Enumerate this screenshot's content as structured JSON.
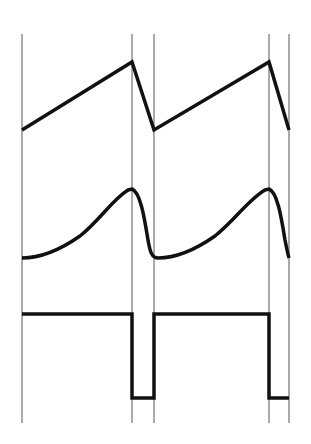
{
  "diagram": {
    "title": "",
    "colors": {
      "background": "#ffffff",
      "waveform": "#111111",
      "marker_line": "#555555"
    },
    "markers_x": [
      22,
      132,
      154,
      269,
      289
    ],
    "marker_y_range": [
      34,
      423
    ],
    "waveforms": [
      {
        "name": "sawtooth",
        "points": [
          [
            22,
            130
          ],
          [
            132,
            62
          ],
          [
            154,
            130
          ],
          [
            269,
            62
          ],
          [
            289,
            130
          ]
        ]
      },
      {
        "name": "smooth-wave",
        "path": "M22,258 C40,258 60,250 80,236 C100,220 112,200 128,190 L132,189 C140,192 144,215 148,240 C150,252 152,258 158,258 C175,258 195,250 215,236 C235,220 248,200 265,190 L269,189 C277,192 281,215 285,240 C287,250 288,255 289,258"
      },
      {
        "name": "square-wave",
        "points": [
          [
            22,
            314
          ],
          [
            132,
            314
          ],
          [
            132,
            398
          ],
          [
            154,
            398
          ],
          [
            154,
            314
          ],
          [
            269,
            314
          ],
          [
            269,
            398
          ],
          [
            289,
            398
          ]
        ]
      }
    ]
  }
}
